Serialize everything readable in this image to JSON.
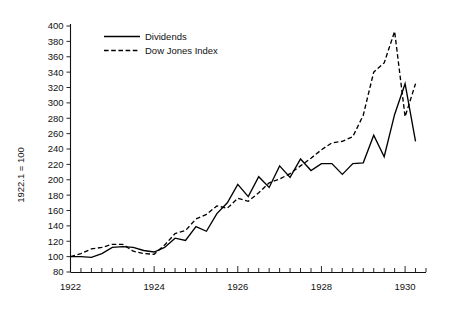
{
  "chart_data": {
    "type": "line",
    "title": "",
    "xlabel": "",
    "ylabel": "1922.1 = 100",
    "xlim": [
      1922.0,
      1930.5
    ],
    "ylim": [
      80,
      400
    ],
    "ytick_step": 20,
    "grid": false,
    "legend_position": "top-left",
    "x_tick_labels": [
      "1922",
      "1924",
      "1926",
      "1928",
      "1930"
    ],
    "x_major_ticks": [
      1922,
      1924,
      1926,
      1928,
      1930
    ],
    "x_minor_tick_interval": 0.25,
    "y_tick_labels": [
      "80",
      "100",
      "120",
      "140",
      "160",
      "180",
      "200",
      "220",
      "240",
      "260",
      "280",
      "300",
      "320",
      "340",
      "360",
      "380",
      "400"
    ],
    "x": [
      1922.0,
      1922.25,
      1922.5,
      1922.75,
      1923.0,
      1923.25,
      1923.5,
      1923.75,
      1924.0,
      1924.25,
      1924.5,
      1924.75,
      1925.0,
      1925.25,
      1925.5,
      1925.75,
      1926.0,
      1926.25,
      1926.5,
      1926.75,
      1927.0,
      1927.25,
      1927.5,
      1927.75,
      1928.0,
      1928.25,
      1928.5,
      1928.75,
      1929.0,
      1929.25,
      1929.5,
      1929.75,
      1930.0,
      1930.25
    ],
    "series": [
      {
        "name": "Dividends",
        "style": "solid",
        "color": "#000000",
        "values": [
          100,
          100,
          99,
          104,
          112,
          113,
          112,
          108,
          106,
          112,
          124,
          121,
          139,
          133,
          156,
          170,
          194,
          178,
          204,
          190,
          218,
          203,
          227,
          212,
          221,
          221,
          207,
          221,
          222,
          258,
          230,
          285,
          325,
          250
        ]
      },
      {
        "name": "Dow Jones Index",
        "style": "dashed",
        "color": "#000000",
        "values": [
          100,
          104,
          110,
          112,
          116,
          116,
          107,
          104,
          103,
          115,
          130,
          134,
          149,
          155,
          166,
          163,
          176,
          172,
          183,
          196,
          201,
          208,
          218,
          228,
          239,
          248,
          250,
          256,
          284,
          340,
          352,
          393,
          282,
          325
        ]
      }
    ],
    "annotations": []
  },
  "legend": {
    "entries": [
      {
        "label": "Dividends",
        "style": "solid"
      },
      {
        "label": "Dow Jones Index",
        "style": "dashed"
      }
    ]
  },
  "axes": {
    "y_axis_title": "1922.1 = 100"
  }
}
